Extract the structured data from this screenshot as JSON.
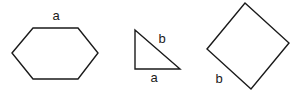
{
  "diagram": {
    "hexagon": {
      "label": "a",
      "points": "12,53 33,28 78,28 98,53 78,79 33,79",
      "label_pos": [
        56,
        20
      ]
    },
    "triangle": {
      "label_hyp": "b",
      "label_base": "a",
      "points": "135,30 135,69 180,69",
      "label_hyp_pos": [
        162,
        43
      ],
      "label_base_pos": [
        154,
        82
      ]
    },
    "square": {
      "label": "b",
      "points": "245,3 289,43 251,89 207,49",
      "label_pos": [
        219,
        83
      ]
    },
    "stroke_color": "#1a1a1a",
    "background": "#ffffff"
  }
}
